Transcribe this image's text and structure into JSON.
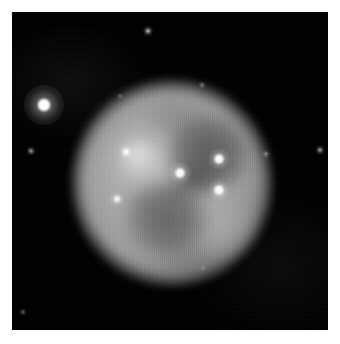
{
  "figure": {
    "kind": "astronomical-image",
    "subject_label": "planetary nebula",
    "morphology_label": "bipolar double-shell planetary nebula with two dark interior cavities",
    "width_px": 340,
    "height_px": 344,
    "border_label": "white page margin",
    "border_color": "#ffffff"
  },
  "sky_field": {
    "label": "sky background field",
    "background_color": "#000000",
    "left_px": 12,
    "top_px": 12,
    "width_px": 316,
    "height_px": 318
  },
  "nebula": {
    "label": "nebula disk",
    "center_x_px": 160,
    "center_y_px": 171,
    "radius_px": 100,
    "peak_gray": "#d8d8d8",
    "mid_gray": "#a8a8a8",
    "edge_gray": "#3c3c3c",
    "features": [
      {
        "name": "bright-knot-west",
        "label": "bright western knot",
        "center_x_px": 129,
        "center_y_px": 147
      },
      {
        "name": "dark-cavity-northeast",
        "label": "dark cavity (north-east eye)",
        "center_x_px": 195,
        "center_y_px": 142
      },
      {
        "name": "dark-cavity-southwest",
        "label": "dark cavity (south-west eye)",
        "center_x_px": 154,
        "center_y_px": 207
      },
      {
        "name": "bright-lobe-southwest",
        "label": "bright lobe south-west",
        "center_x_px": 135,
        "center_y_px": 219
      },
      {
        "name": "bright-lobe-southeast",
        "label": "bright lobe south-east",
        "center_x_px": 209,
        "center_y_px": 214
      }
    ]
  },
  "stars": [
    {
      "name": "field-star-bright-west",
      "label": "bright foreground field star",
      "x_px": 44,
      "y_px": 105,
      "core_px": 12,
      "glow_px": 40,
      "brightness": 1.0
    },
    {
      "name": "central-star",
      "label": "central star of the nebula",
      "x_px": 180,
      "y_px": 173,
      "core_px": 9,
      "glow_px": 22,
      "brightness": 0.95
    },
    {
      "name": "star-northeast-inner",
      "label": "embedded star north-east",
      "x_px": 219,
      "y_px": 159,
      "core_px": 9,
      "glow_px": 21,
      "brightness": 0.95
    },
    {
      "name": "star-southeast-inner",
      "label": "embedded star south-east",
      "x_px": 219,
      "y_px": 190,
      "core_px": 9,
      "glow_px": 21,
      "brightness": 0.95
    },
    {
      "name": "star-west-upper",
      "label": "star on west rim (upper)",
      "x_px": 126,
      "y_px": 152,
      "core_px": 6,
      "glow_px": 15,
      "brightness": 0.85
    },
    {
      "name": "star-west-lower",
      "label": "star on west rim (lower)",
      "x_px": 117,
      "y_px": 199,
      "core_px": 6,
      "glow_px": 15,
      "brightness": 0.8
    },
    {
      "name": "field-star-top",
      "label": "faint field star near top edge",
      "x_px": 148,
      "y_px": 31,
      "core_px": 4,
      "glow_px": 11,
      "brightness": 0.6
    },
    {
      "name": "field-star-west-faint",
      "label": "faint field star west",
      "x_px": 31,
      "y_px": 151,
      "core_px": 4,
      "glow_px": 10,
      "brightness": 0.45
    },
    {
      "name": "field-star-east-edge",
      "label": "faint field star near east edge",
      "x_px": 320,
      "y_px": 150,
      "core_px": 4,
      "glow_px": 10,
      "brightness": 0.5
    },
    {
      "name": "field-star-east-rim",
      "label": "faint star on east rim",
      "x_px": 266,
      "y_px": 154,
      "core_px": 3,
      "glow_px": 9,
      "brightness": 0.4
    },
    {
      "name": "star-north-rim",
      "label": "faint star on north rim",
      "x_px": 202,
      "y_px": 85,
      "core_px": 3,
      "glow_px": 8,
      "brightness": 0.35
    },
    {
      "name": "field-star-southwest-corner",
      "label": "very faint field star south-west",
      "x_px": 23,
      "y_px": 312,
      "core_px": 3,
      "glow_px": 8,
      "brightness": 0.3
    },
    {
      "name": "field-star-north-faint",
      "label": "very faint field star north-west of disk",
      "x_px": 120,
      "y_px": 96,
      "core_px": 2,
      "glow_px": 7,
      "brightness": 0.28
    },
    {
      "name": "field-star-southeast-faint",
      "label": "very faint field star south-east",
      "x_px": 203,
      "y_px": 268,
      "core_px": 2,
      "glow_px": 7,
      "brightness": 0.22
    }
  ],
  "chart_data": {
    "type": "heatmap",
    "title": "",
    "xlabel": "",
    "ylabel": "",
    "colormap": "grayscale",
    "intensity_range": [
      0,
      255
    ]
  }
}
